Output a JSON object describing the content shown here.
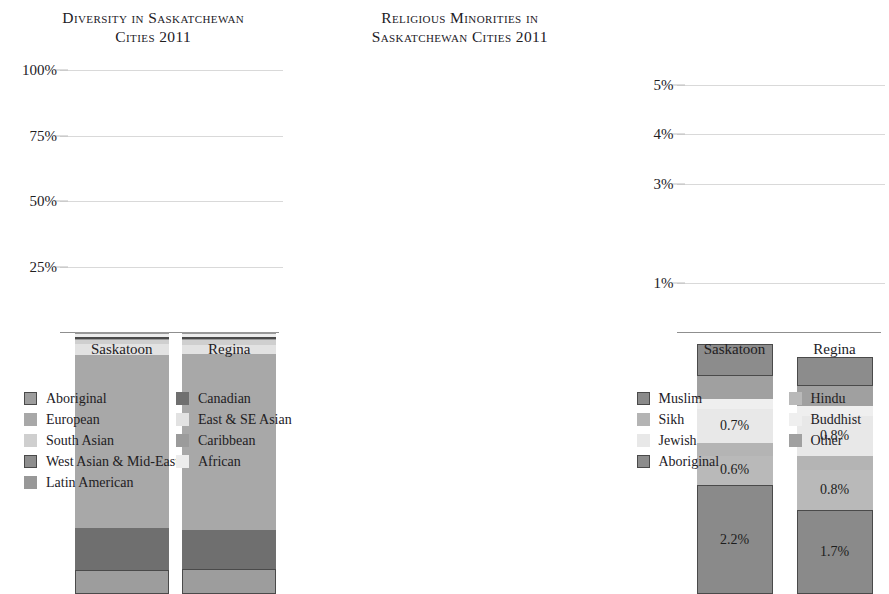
{
  "charts": {
    "left": {
      "title_line1": "Diversity in Saskatchewan",
      "title_line2": "Cities 2011",
      "yticks": [
        "100%",
        "75%",
        "50%",
        "25%"
      ],
      "categories": [
        "Saskatoon",
        "Regina"
      ],
      "legend_col1": [
        {
          "label": "Aboriginal",
          "color": "#9d9d9d",
          "outlined": true
        },
        {
          "label": "European",
          "color": "#a8a8a8",
          "outlined": false
        },
        {
          "label": "South Asian",
          "color": "#cfcfcf",
          "outlined": false
        },
        {
          "label": "West Asian & Mid-East",
          "color": "#8e8e8e",
          "outlined": true
        },
        {
          "label": "Latin American",
          "color": "#989898",
          "outlined": false
        }
      ],
      "legend_col2": [
        {
          "label": "Canadian",
          "color": "#6f6f6f",
          "outlined": false
        },
        {
          "label": "East & SE Asian",
          "color": "#e2e2e2",
          "outlined": false
        },
        {
          "label": "Caribbean",
          "color": "#9b9b9b",
          "outlined": false
        },
        {
          "label": "African",
          "color": "#ededed",
          "outlined": false
        }
      ]
    },
    "right": {
      "title_line1": "Religious Minorities in",
      "title_line2": "Saskatchewan Cities 2011",
      "yticks": [
        "5%",
        "4%",
        "3%",
        "1%"
      ],
      "categories": [
        "Saskatoon",
        "Regina"
      ],
      "legend_col1": [
        {
          "label": "Muslim",
          "color": "#8a8a8a",
          "outlined": true
        },
        {
          "label": "Sikh",
          "color": "#b4b4b4",
          "outlined": false
        },
        {
          "label": "Jewish",
          "color": "#e8e8e8",
          "outlined": false
        },
        {
          "label": "Aboriginal",
          "color": "#8c8c8c",
          "outlined": true
        }
      ],
      "legend_col2": [
        {
          "label": "Hindu",
          "color": "#b9b9b9",
          "outlined": false
        },
        {
          "label": "Buddhist",
          "color": "#efefef",
          "outlined": false
        },
        {
          "label": "Other",
          "color": "#a0a0a0",
          "outlined": false
        }
      ]
    }
  },
  "chart_data": [
    {
      "type": "bar",
      "stacked": true,
      "title": "Diversity in Saskatchewan Cities 2011",
      "xlabel": "",
      "ylabel": "",
      "ylim": [
        0,
        100
      ],
      "yticks": [
        25,
        50,
        75,
        100
      ],
      "ytick_labels": [
        "25%",
        "50%",
        "75%",
        "100%"
      ],
      "grid": true,
      "legend_position": "bottom",
      "categories": [
        "Saskatoon",
        "Regina"
      ],
      "series": [
        {
          "name": "Aboriginal",
          "color": "#9d9d9d",
          "values": [
            9.3,
            9.6
          ]
        },
        {
          "name": "Canadian",
          "color": "#6f6f6f",
          "values": [
            16.0,
            15.0
          ]
        },
        {
          "name": "European",
          "color": "#a8a8a8",
          "values": [
            66.0,
            67.0
          ]
        },
        {
          "name": "East & SE Asian",
          "color": "#e2e2e2",
          "values": [
            4.2,
            3.6
          ]
        },
        {
          "name": "South Asian",
          "color": "#cfcfcf",
          "values": [
            1.6,
            1.8
          ]
        },
        {
          "name": "Caribbean",
          "color": "#9b9b9b",
          "values": [
            0.5,
            0.5
          ]
        },
        {
          "name": "West Asian & Mid-East",
          "color": "#8e8e8e",
          "values": [
            0.6,
            0.6
          ]
        },
        {
          "name": "African",
          "color": "#ededed",
          "values": [
            0.9,
            1.0
          ]
        },
        {
          "name": "Latin American",
          "color": "#989898",
          "values": [
            0.9,
            0.9
          ]
        }
      ]
    },
    {
      "type": "bar",
      "stacked": true,
      "title": "Religious Minorities in Saskatchewan Cities 2011",
      "xlabel": "",
      "ylabel": "",
      "ylim": [
        0,
        5.3
      ],
      "yticks": [
        1,
        3,
        4,
        5
      ],
      "ytick_labels": [
        "1%",
        "3%",
        "4%",
        "5%"
      ],
      "grid": true,
      "legend_position": "bottom",
      "categories": [
        "Saskatoon",
        "Regina"
      ],
      "series": [
        {
          "name": "Muslim",
          "color": "#8a8a8a",
          "values": [
            2.2,
            1.7
          ],
          "labels": [
            "2.2%",
            "1.7%"
          ]
        },
        {
          "name": "Hindu",
          "color": "#b9b9b9",
          "values": [
            0.6,
            0.8
          ],
          "labels": [
            "0.6%",
            "0.8%"
          ]
        },
        {
          "name": "Sikh",
          "color": "#b4b4b4",
          "values": [
            0.25,
            0.3
          ],
          "labels": [
            "",
            ""
          ]
        },
        {
          "name": "Jewish",
          "color": "#e8e8e8",
          "values": [
            0.7,
            0.8
          ],
          "labels": [
            "0.7%",
            "0.8%"
          ]
        },
        {
          "name": "Buddhist",
          "color": "#efefef",
          "values": [
            0.2,
            0.2
          ],
          "labels": [
            "",
            ""
          ]
        },
        {
          "name": "Other",
          "color": "#a0a0a0",
          "values": [
            0.45,
            0.4
          ],
          "labels": [
            "",
            ""
          ]
        },
        {
          "name": "Aboriginal",
          "color": "#8c8c8c",
          "values": [
            0.65,
            0.6
          ],
          "labels": [
            "",
            ""
          ]
        }
      ]
    }
  ]
}
